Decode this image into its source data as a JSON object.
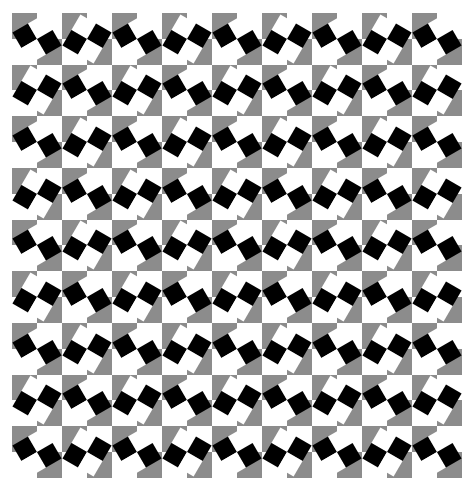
{
  "figure": {
    "rows": 9,
    "cols": 9,
    "colors": {
      "gray": "#8c8c8c",
      "white": "#ffffff",
      "black": "#000000"
    },
    "background_quadrants": [
      "gray",
      "white",
      "white",
      "gray"
    ],
    "tile_types": {
      "A": {
        "rotation_deg": -30,
        "checker": [
          "black",
          "white",
          "white",
          "black"
        ]
      },
      "B": {
        "rotation_deg": 30,
        "checker": [
          "white",
          "black",
          "black",
          "white"
        ]
      }
    },
    "arrangement": "checkerboard of tile types A and B, A at top-left"
  }
}
